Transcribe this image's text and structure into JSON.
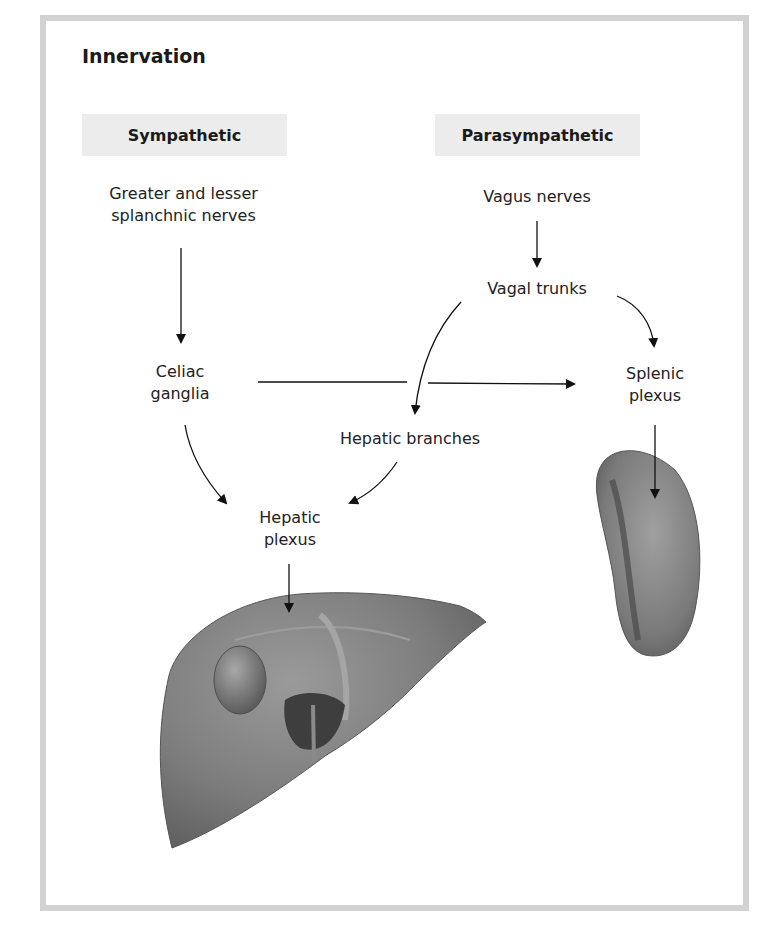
{
  "title": "Innervation",
  "headers": {
    "sympathetic": "Sympathetic",
    "parasympathetic": "Parasympathetic"
  },
  "nodes": {
    "splanchnic_line1": "Greater and lesser",
    "splanchnic_line2": "splanchnic nerves",
    "celiac_line1": "Celiac",
    "celiac_line2": "ganglia",
    "vagus": "Vagus nerves",
    "vagal_trunks": "Vagal trunks",
    "splenic_line1": "Splenic",
    "splenic_line2": "plexus",
    "hepatic_branches": "Hepatic branches",
    "hepatic_plexus_line1": "Hepatic",
    "hepatic_plexus_line2": "plexus"
  },
  "illustrations": {
    "liver": "liver-illustration",
    "spleen": "spleen-illustration"
  },
  "edges": [
    {
      "from": "Greater and lesser splanchnic nerves",
      "to": "Celiac ganglia"
    },
    {
      "from": "Celiac ganglia",
      "to": "Splenic plexus"
    },
    {
      "from": "Celiac ganglia",
      "to": "Hepatic plexus"
    },
    {
      "from": "Vagus nerves",
      "to": "Vagal trunks"
    },
    {
      "from": "Vagal trunks",
      "to": "Hepatic branches"
    },
    {
      "from": "Vagal trunks",
      "to": "Splenic plexus"
    },
    {
      "from": "Hepatic branches",
      "to": "Hepatic plexus"
    },
    {
      "from": "Hepatic plexus",
      "to": "Liver"
    },
    {
      "from": "Splenic plexus",
      "to": "Spleen"
    }
  ],
  "colors": {
    "frame": "#d2d2d2",
    "header_bg": "#ececec",
    "organ_fill": "#7f7f7f"
  }
}
